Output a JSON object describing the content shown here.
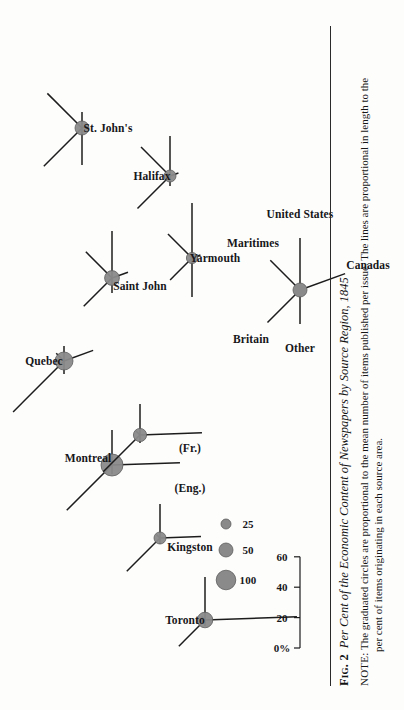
{
  "figure": {
    "number_label": "Fig. 2",
    "title": "Per Cent of the Economic Content of Newspapers by Source Region, 1845",
    "note_label": "NOTE:",
    "note_line1": "The graduated circles are proportional to the mean number of items published per issue.  The lines are proportional in length to the",
    "note_line2": "per cent of items originating in each source area."
  },
  "scale": {
    "name": "percent-scale-bar",
    "ticks": [
      "0%",
      "20",
      "40",
      "60"
    ],
    "values": [
      0,
      20,
      40,
      60
    ]
  },
  "circle_legend": {
    "name": "graduated-circle-legend",
    "items": [
      {
        "label": "25",
        "value": 25,
        "radius": 5.0
      },
      {
        "label": "50",
        "value": 50,
        "radius": 7.0
      },
      {
        "label": "100",
        "value": 100,
        "radius": 9.8
      }
    ]
  },
  "direction_key": {
    "name": "ray-direction-key",
    "title": "",
    "rays": [
      {
        "label": "Britain",
        "angle_deg": 135
      },
      {
        "label": "Maritimes",
        "angle_deg": 45
      },
      {
        "label": "United States",
        "angle_deg": 0
      },
      {
        "label": "Canadas",
        "angle_deg": 290
      },
      {
        "label": "Other",
        "angle_deg": 180
      }
    ]
  },
  "colors": {
    "circle_fill": "#8a8a8a",
    "circle_edge": "#5d5d5d",
    "ray": "#1c1c1c",
    "text": "#17171a",
    "paper": "#fdfdfc"
  },
  "chart_data": {
    "type": "scatter",
    "title": "Per Cent of the Economic Content of Newspapers by Source Region, 1845",
    "xlabel": "",
    "ylabel": "",
    "grid": false,
    "legend": "graduated circles = mean items per issue; ray length = per cent of items from source area",
    "axis_scale_ticks": [
      0,
      20,
      40,
      60
    ],
    "axis_scale_tick_labels": [
      "0%",
      "20",
      "40",
      "60"
    ],
    "ray_directions": {
      "Britain": 135,
      "Maritimes": 45,
      "United States": 0,
      "Canadas": 290,
      "Other": 180
    },
    "circle_size_legend": {
      "25": 5.0,
      "50": 7.0,
      "100": 9.8
    },
    "categories": [
      "St. John's",
      "Halifax",
      "Yarmouth",
      "Saint John",
      "Quebec",
      "Montreal (Eng.)",
      "Montreal (Fr.)",
      "Kingston",
      "Toronto"
    ],
    "series": [
      {
        "name": "St. John's",
        "circle_value": 50,
        "circle_radius": 7.0,
        "position": {
          "x": 582,
          "y": 82
        },
        "rays": [
          {
            "source": "Britain",
            "percent": 36,
            "angle_deg": 135,
            "length": 54
          },
          {
            "source": "Maritimes",
            "percent": 32,
            "angle_deg": 45,
            "length": 49
          },
          {
            "source": "United States",
            "percent": 10,
            "angle_deg": 0,
            "length": 16
          },
          {
            "source": "Canadas",
            "percent": 4,
            "angle_deg": 290,
            "length": 7
          },
          {
            "source": "Other",
            "percent": 24,
            "angle_deg": 180,
            "length": 37
          }
        ]
      },
      {
        "name": "Halifax",
        "circle_value": 35,
        "circle_radius": 6.0,
        "position": {
          "x": 534,
          "y": 170
        },
        "rays": [
          {
            "source": "Britain",
            "percent": 30,
            "angle_deg": 135,
            "length": 46
          },
          {
            "source": "Maritimes",
            "percent": 27,
            "angle_deg": 45,
            "length": 41
          },
          {
            "source": "United States",
            "percent": 26,
            "angle_deg": 0,
            "length": 40
          },
          {
            "source": "Canadas",
            "percent": 5,
            "angle_deg": 290,
            "length": 9
          },
          {
            "source": "Other",
            "percent": 6,
            "angle_deg": 180,
            "length": 10
          }
        ]
      },
      {
        "name": "Yarmouth",
        "circle_value": 30,
        "circle_radius": 5.6,
        "position": {
          "x": 452,
          "y": 192
        },
        "rays": [
          {
            "source": "Britain",
            "percent": 20,
            "angle_deg": 135,
            "length": 31
          },
          {
            "source": "Maritimes",
            "percent": 22,
            "angle_deg": 45,
            "length": 34
          },
          {
            "source": "United States",
            "percent": 36,
            "angle_deg": 0,
            "length": 55
          },
          {
            "source": "Canadas",
            "percent": 5,
            "angle_deg": 290,
            "length": 9
          },
          {
            "source": "Other",
            "percent": 25,
            "angle_deg": 180,
            "length": 39
          }
        ]
      },
      {
        "name": "Saint John",
        "circle_value": 55,
        "circle_radius": 7.4,
        "position": {
          "x": 432,
          "y": 112
        },
        "rays": [
          {
            "source": "Britain",
            "percent": 26,
            "angle_deg": 135,
            "length": 40
          },
          {
            "source": "Maritimes",
            "percent": 24,
            "angle_deg": 45,
            "length": 37
          },
          {
            "source": "United States",
            "percent": 31,
            "angle_deg": 0,
            "length": 47
          },
          {
            "source": "Canadas",
            "percent": 10,
            "angle_deg": 290,
            "length": 17
          },
          {
            "source": "Other",
            "percent": 9,
            "angle_deg": 180,
            "length": 15
          }
        ]
      },
      {
        "name": "Quebec",
        "circle_value": 75,
        "circle_radius": 9.0,
        "position": {
          "x": 349,
          "y": 64
        },
        "rays": [
          {
            "source": "Britain",
            "percent": 48,
            "angle_deg": 135,
            "length": 72
          },
          {
            "source": "Maritimes",
            "percent": 6,
            "angle_deg": 45,
            "length": 11
          },
          {
            "source": "United States",
            "percent": 9,
            "angle_deg": 0,
            "length": 15
          },
          {
            "source": "Canadas",
            "percent": 20,
            "angle_deg": 290,
            "length": 31
          },
          {
            "source": "Other",
            "percent": 8,
            "angle_deg": 180,
            "length": 13
          }
        ]
      },
      {
        "name": "Montreal (Eng.)",
        "circle_value": 100,
        "circle_radius": 11.0,
        "position": {
          "x": 245,
          "y": 112
        },
        "rays": [
          {
            "source": "Britain",
            "percent": 42,
            "angle_deg": 135,
            "length": 64
          },
          {
            "source": "Maritimes",
            "percent": 4,
            "angle_deg": 45,
            "length": 7
          },
          {
            "source": "United States",
            "percent": 23,
            "angle_deg": 0,
            "length": 35
          },
          {
            "source": "Canadas",
            "percent": 44,
            "angle_deg": 272,
            "length": 68
          },
          {
            "source": "Other",
            "percent": 5,
            "angle_deg": 180,
            "length": 9
          }
        ]
      },
      {
        "name": "Montreal (Fr.)",
        "circle_value": 45,
        "circle_radius": 6.6,
        "position": {
          "x": 275,
          "y": 140
        },
        "rays": [
          {
            "source": "Britain",
            "percent": 34,
            "angle_deg": 135,
            "length": 52
          },
          {
            "source": "Maritimes",
            "percent": 3,
            "angle_deg": 45,
            "length": 6
          },
          {
            "source": "United States",
            "percent": 20,
            "angle_deg": 0,
            "length": 31
          },
          {
            "source": "Canadas",
            "percent": 40,
            "angle_deg": 272,
            "length": 62
          },
          {
            "source": "Other",
            "percent": 4,
            "angle_deg": 180,
            "length": 8
          }
        ]
      },
      {
        "name": "Kingston",
        "circle_value": 35,
        "circle_radius": 6.0,
        "position": {
          "x": 172,
          "y": 160
        },
        "rays": [
          {
            "source": "Britain",
            "percent": 31,
            "angle_deg": 135,
            "length": 47
          },
          {
            "source": "Maritimes",
            "percent": 2,
            "angle_deg": 45,
            "length": 5
          },
          {
            "source": "United States",
            "percent": 22,
            "angle_deg": 0,
            "length": 34
          },
          {
            "source": "Canadas",
            "percent": 27,
            "angle_deg": 272,
            "length": 41
          },
          {
            "source": "Other",
            "percent": 3,
            "angle_deg": 180,
            "length": 6
          }
        ]
      },
      {
        "name": "Toronto",
        "circle_value": 60,
        "circle_radius": 7.8,
        "position": {
          "x": 90,
          "y": 205
        },
        "rays": [
          {
            "source": "Britain",
            "percent": 24,
            "angle_deg": 135,
            "length": 37
          },
          {
            "source": "Maritimes",
            "percent": 2,
            "angle_deg": 45,
            "length": 5
          },
          {
            "source": "United States",
            "percent": 28,
            "angle_deg": 0,
            "length": 43
          },
          {
            "source": "Canadas",
            "percent": 60,
            "angle_deg": 272,
            "length": 92
          },
          {
            "source": "Other",
            "percent": 3,
            "angle_deg": 180,
            "length": 6
          }
        ]
      }
    ],
    "city_label_positions": [
      {
        "name": "St. John's",
        "x": 582,
        "y": 108,
        "anchor": "middle"
      },
      {
        "name": "Halifax",
        "x": 534,
        "y": 152,
        "anchor": "middle"
      },
      {
        "name": "Yarmouth",
        "x": 452,
        "y": 215,
        "anchor": "middle"
      },
      {
        "name": "Saint John",
        "x": 424,
        "y": 140,
        "anchor": "middle"
      },
      {
        "name": "Quebec",
        "x": 349,
        "y": 44,
        "anchor": "middle"
      },
      {
        "name": "Montreal",
        "x": 252,
        "y": 88,
        "anchor": "middle"
      },
      {
        "name": "(Eng.)",
        "x": 222,
        "y": 190,
        "anchor": "middle"
      },
      {
        "name": "(Fr.)",
        "x": 262,
        "y": 190,
        "anchor": "middle"
      },
      {
        "name": "Kingston",
        "x": 163,
        "y": 190,
        "anchor": "middle"
      },
      {
        "name": "Toronto",
        "x": 90,
        "y": 185,
        "anchor": "middle"
      }
    ]
  }
}
